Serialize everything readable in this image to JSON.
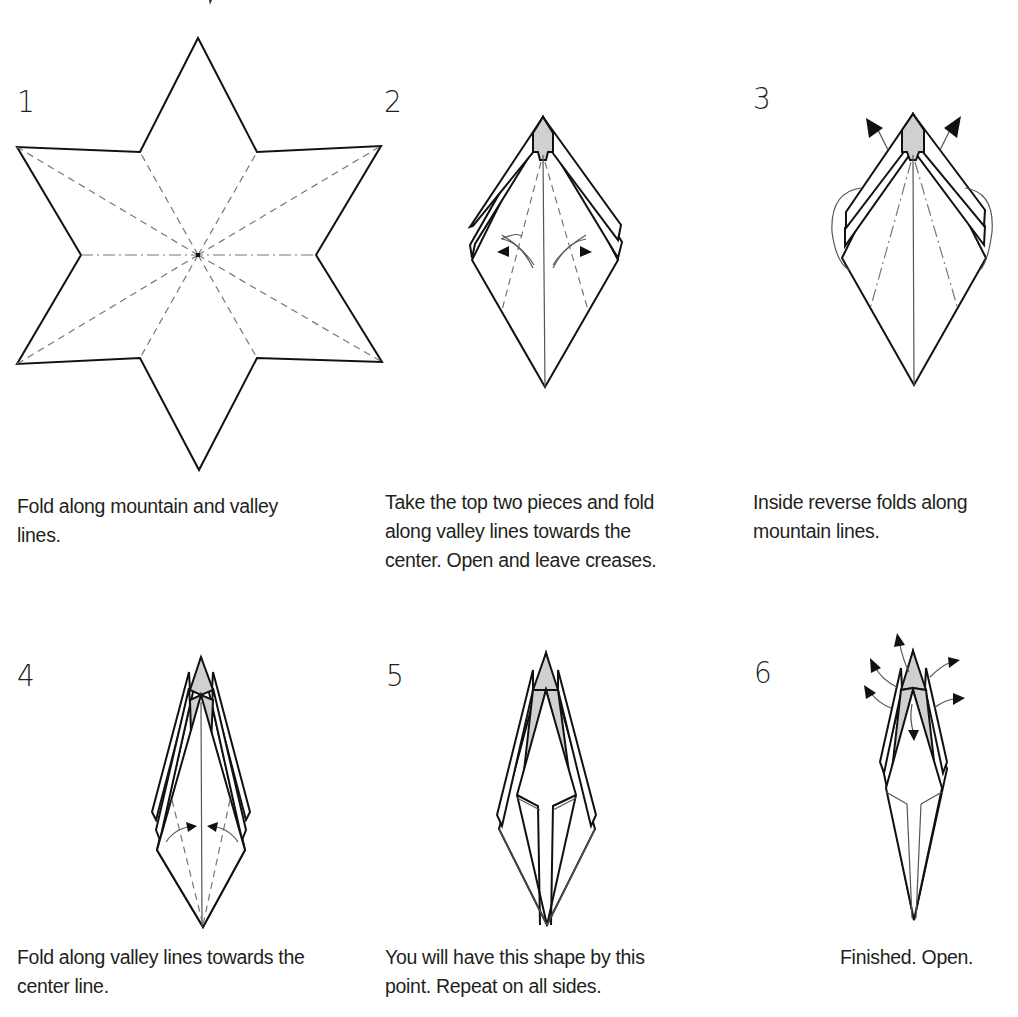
{
  "document": {
    "type": "origami instruction sheet",
    "subject": "six-pointed star fold sequence"
  },
  "steps": [
    {
      "number": "1",
      "caption_lines": [
        "Fold along mountain and valley",
        "lines."
      ],
      "figure": "six-pointed star crease pattern with mountain and valley lines radiating from center"
    },
    {
      "number": "2",
      "caption_lines": [
        "Take the top two pieces and fold",
        "along valley lines towards the",
        "center. Open and leave creases."
      ],
      "figure": "folded kite with layered top and curved valley-fold arrows"
    },
    {
      "number": "3",
      "caption_lines": [
        "Inside reverse folds along",
        "mountain lines."
      ],
      "figure": "kite shape with inside reverse fold arrows at top"
    },
    {
      "number": "4",
      "caption_lines": [
        "Fold along valley lines towards the",
        "center line."
      ],
      "figure": "narrow layered point with arrows folding toward center"
    },
    {
      "number": "5",
      "caption_lines": [
        "You will have this shape by this",
        "point. Repeat on all sides."
      ],
      "figure": "elongated narrow shape with inner folds"
    },
    {
      "number": "6",
      "caption_lines": [
        "Finished. Open."
      ],
      "figure": "finished narrow shape with opening arrows"
    }
  ],
  "colors": {
    "line": "#111111",
    "shade": "#d0d0d0",
    "crease": "#777777",
    "text": "#231f20",
    "background": "#ffffff"
  }
}
